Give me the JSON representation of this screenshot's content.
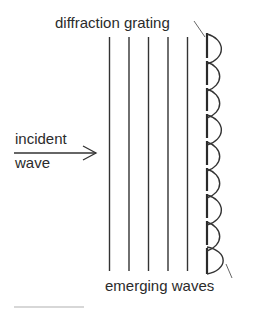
{
  "diagram": {
    "labels": {
      "grating": "diffraction grating",
      "incident_line1": "incident",
      "incident_line2": "wave",
      "emerging": "emerging waves"
    },
    "incident_wavefronts": 5,
    "grating_slits": 9,
    "colors": {
      "ink": "#2b2b2b",
      "background": "#ffffff"
    }
  }
}
